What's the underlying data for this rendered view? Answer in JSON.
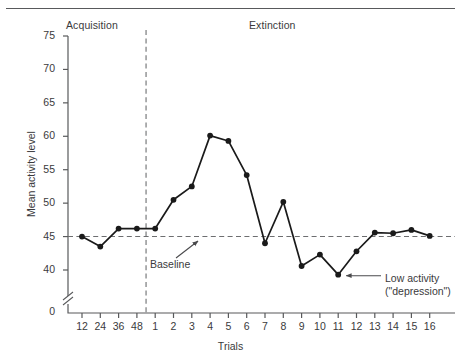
{
  "chart_data": {
    "type": "line",
    "title": "",
    "xlabel": "Trials",
    "ylabel": "Mean activity level",
    "ylim": [
      38,
      75
    ],
    "yticks": [
      40,
      45,
      50,
      55,
      60,
      65,
      70,
      75
    ],
    "y_origin_label": "0",
    "axis_break": true,
    "grid": false,
    "legend": "none",
    "categories": [
      "12",
      "24",
      "36",
      "48",
      "1",
      "2",
      "3",
      "4",
      "5",
      "6",
      "7",
      "8",
      "9",
      "10",
      "11",
      "12",
      "13",
      "14",
      "15",
      "16"
    ],
    "values": [
      45.0,
      43.5,
      46.2,
      46.2,
      46.2,
      50.5,
      52.5,
      60.1,
      59.3,
      54.2,
      44.0,
      50.2,
      40.6,
      42.3,
      39.3,
      42.8,
      45.6,
      45.5,
      46.0,
      45.1
    ],
    "phases": [
      {
        "name": "Acquisition",
        "categories": [
          "12",
          "24",
          "36",
          "48"
        ]
      },
      {
        "name": "Extinction",
        "categories": [
          "1",
          "2",
          "3",
          "4",
          "5",
          "6",
          "7",
          "8",
          "9",
          "10",
          "11",
          "12",
          "13",
          "14",
          "15",
          "16"
        ]
      }
    ],
    "reference_lines": [
      {
        "name": "baseline",
        "orientation": "horizontal",
        "value": 45,
        "style": "dashed",
        "label": "Baseline"
      },
      {
        "name": "phase-divider",
        "orientation": "vertical",
        "between": [
          "48",
          "1"
        ],
        "style": "dashed",
        "label": ""
      }
    ],
    "annotations": [
      {
        "name": "baseline",
        "text": "Baseline",
        "points_to": "baseline reference line"
      },
      {
        "name": "low-activity",
        "text_line1": "Low activity",
        "text_line2": "(\"depression\")",
        "points_to": "trial 11 minimum"
      }
    ],
    "series_color": "#1a1a1a",
    "axis_color": "#58595b",
    "text_color": "#3a3a3c"
  },
  "labels": {
    "phase_acquisition": "Acquisition",
    "phase_extinction": "Extinction",
    "axis_title_y": "Mean activity level",
    "axis_title_x": "Trials",
    "y_zero": "0",
    "annotation_baseline": "Baseline",
    "annotation_low_1": "Low activity",
    "annotation_low_2": "(\"depression\")"
  }
}
